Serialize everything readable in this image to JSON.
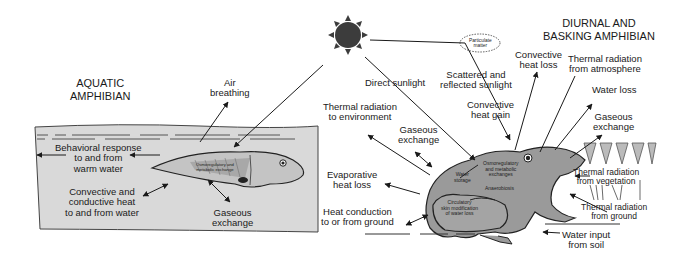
{
  "aquatic": {
    "title_line1": "AQUATIC",
    "title_line2": "AMPHIBIAN",
    "labels": {
      "air_breathing_1": "Air",
      "air_breathing_2": "breathing",
      "behavioral_1": "Behavioral response",
      "behavioral_2": "to and from",
      "behavioral_3": "warm water",
      "convective_1": "Convective and",
      "convective_2": "conductive heat",
      "convective_3": "to and from water",
      "gaseous_1": "Gaseous",
      "gaseous_2": "exchange",
      "internal_1": "Osmoregulatory and",
      "internal_2": "metabolic exchange"
    }
  },
  "terrestrial": {
    "title_line1": "DIURNAL AND",
    "title_line2": "BASKING AMPHIBIAN",
    "labels": {
      "particulate_1": "Particulate",
      "particulate_2": "matter",
      "direct_sunlight": "Direct sunlight",
      "scattered_1": "Scattered and",
      "scattered_2": "reflected sunlight",
      "conv_gain_1": "Convective",
      "conv_gain_2": "heat gain",
      "conv_loss_1": "Convective",
      "conv_loss_2": "heat loss",
      "thermal_atm_1": "Thermal radiation",
      "thermal_atm_2": "from atmosphere",
      "water_loss": "Water loss",
      "gas_right_1": "Gaseous",
      "gas_right_2": "exchange",
      "thermal_env_1": "Thermal radiation",
      "thermal_env_2": "to environment",
      "gas_left_1": "Gaseous",
      "gas_left_2": "exchange",
      "evap_1": "Evaporative",
      "evap_2": "heat loss",
      "conduction_1": "Heat conduction",
      "conduction_2": "to or from ground",
      "thermal_veg_1": "Thermal radiation",
      "thermal_veg_2": "from vegetation",
      "thermal_ground_1": "Thermal radiation",
      "thermal_ground_2": "from ground",
      "water_input_1": "Water input",
      "water_input_2": "from soil"
    },
    "frog_internal": {
      "osmo_1": "Osmoregulatory",
      "osmo_2": "and metabolic",
      "osmo_3": "exchanges",
      "water_storage_1": "Water",
      "water_storage_2": "storage",
      "anaerobiosis": "Anaerobiosis",
      "circ_1": "Circulatory",
      "circ_2": "skin modification",
      "circ_3": "of water loss"
    }
  },
  "colors": {
    "water": "#d9d9d9",
    "animal_fill": "#9a9a9a",
    "tadpole_fill": "#c4c4c4",
    "sun": "#3c3c3c",
    "ink": "#1a1a1a"
  }
}
